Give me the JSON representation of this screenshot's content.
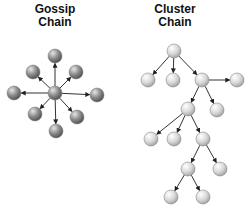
{
  "gossip": {
    "title_line1": "Gossip",
    "title_line2": "Chain",
    "center": {
      "x": 55,
      "y": 93
    },
    "nodes": [
      {
        "x": 55,
        "y": 56
      },
      {
        "x": 33,
        "y": 72
      },
      {
        "x": 76,
        "y": 72
      },
      {
        "x": 14,
        "y": 93
      },
      {
        "x": 97,
        "y": 95
      },
      {
        "x": 35,
        "y": 114
      },
      {
        "x": 77,
        "y": 117
      },
      {
        "x": 56,
        "y": 131
      }
    ],
    "node_color": "#8a8a8a"
  },
  "cluster": {
    "title_line1": "Cluster",
    "title_line2": "Chain",
    "nodes": [
      {
        "id": "n0",
        "x": 174,
        "y": 51
      },
      {
        "id": "n1",
        "x": 148,
        "y": 80
      },
      {
        "id": "n2",
        "x": 173,
        "y": 80
      },
      {
        "id": "n3",
        "x": 202,
        "y": 80
      },
      {
        "id": "n4",
        "x": 237,
        "y": 80
      },
      {
        "id": "n5",
        "x": 188,
        "y": 109
      },
      {
        "id": "n6",
        "x": 217,
        "y": 110
      },
      {
        "id": "n7",
        "x": 151,
        "y": 139
      },
      {
        "id": "n8",
        "x": 174,
        "y": 139
      },
      {
        "id": "n9",
        "x": 203,
        "y": 139
      },
      {
        "id": "n10",
        "x": 188,
        "y": 169
      },
      {
        "id": "n11",
        "x": 220,
        "y": 169
      },
      {
        "id": "n12",
        "x": 171,
        "y": 197
      },
      {
        "id": "n13",
        "x": 203,
        "y": 197
      }
    ],
    "edges": [
      [
        "n0",
        "n1"
      ],
      [
        "n0",
        "n2"
      ],
      [
        "n0",
        "n3"
      ],
      [
        "n3",
        "n4"
      ],
      [
        "n3",
        "n5"
      ],
      [
        "n3",
        "n6"
      ],
      [
        "n5",
        "n7"
      ],
      [
        "n5",
        "n8"
      ],
      [
        "n5",
        "n9"
      ],
      [
        "n9",
        "n10"
      ],
      [
        "n9",
        "n11"
      ],
      [
        "n10",
        "n12"
      ],
      [
        "n10",
        "n13"
      ]
    ],
    "node_color": "#d6d6d6"
  }
}
